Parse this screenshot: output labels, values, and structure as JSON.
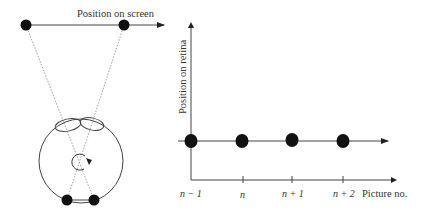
{
  "left_panel": {
    "screen_axis_label": "Position on screen",
    "description": "Eye tracking a moving object across the screen"
  },
  "right_panel": {
    "y_axis_label": "Position on retina",
    "x_axis_label": "Picture no.",
    "ticks": [
      "n − 1",
      "n",
      "n + 1",
      "n + 2"
    ]
  },
  "colors": {
    "ink": "#111111",
    "line": "#555555",
    "dotted": "#888888",
    "text": "#333333",
    "background": "#ffffff"
  }
}
